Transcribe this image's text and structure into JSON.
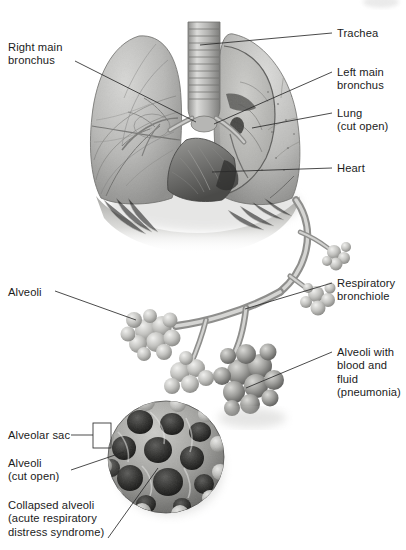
{
  "figure": {
    "style": "grayscale medical illustration",
    "width": 406,
    "height": 550,
    "ink": "#1b1b1b",
    "leader_color": "#2a2a2a",
    "background": "#ffffff"
  },
  "labels": {
    "right_main_bronchus": "Right main\nbronchus",
    "trachea": "Trachea",
    "left_main_bronchus": "Left main\nbronchus",
    "lung_cut_open": "Lung\n(cut open)",
    "heart": "Heart",
    "alveoli": "Alveoli",
    "respiratory_bronchiole": "Respiratory\nbronchiole",
    "alveoli_pneumonia": "Alveoli with\nblood and\nfluid\n(pneumonia)",
    "alveolar_sac": "Alveolar sac",
    "alveoli_cut_open": "Alveoli\n(cut open)",
    "collapsed_alveoli": "Collapsed alveoli\n(acute respiratory\ndistress syndrome)"
  }
}
